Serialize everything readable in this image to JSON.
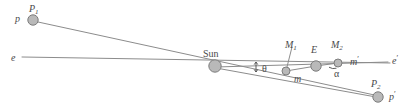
{
  "figure": {
    "type": "astronomical-geometry-diagram",
    "background": "#ffffff",
    "line_color": "#8c8c8c",
    "body_fill": "#b9b9b9",
    "body_stroke": "#7d7d7d",
    "label_color": "#4a4a4a",
    "width": 414,
    "height": 111
  },
  "bodies": [
    {
      "id": "P1",
      "label": "P",
      "sub": "1",
      "x": 33,
      "y": 20,
      "r": 5.2
    },
    {
      "id": "Sun",
      "label": "Sun",
      "sub": "",
      "x": 215,
      "y": 66,
      "r": 6.2
    },
    {
      "id": "M1",
      "label": "M",
      "sub": "1",
      "x": 286,
      "y": 71,
      "r": 4.0
    },
    {
      "id": "E",
      "label": "E",
      "sub": "",
      "x": 316,
      "y": 66,
      "r": 5.2
    },
    {
      "id": "M2",
      "label": "M",
      "sub": "2",
      "x": 338,
      "y": 63,
      "r": 4.0
    },
    {
      "id": "P2",
      "label": "P",
      "sub": "2",
      "x": 378,
      "y": 97,
      "r": 5.2
    }
  ],
  "labels": {
    "p1": {
      "text": "P",
      "sub": "1",
      "x": 29,
      "y": 4
    },
    "p": {
      "text": "p",
      "x": 15,
      "y": 14
    },
    "e": {
      "text": "e",
      "x": 11,
      "y": 53
    },
    "sun": {
      "text": "Sun",
      "x": 203,
      "y": 49
    },
    "m1": {
      "text": "M",
      "sub": "1",
      "x": 285,
      "y": 40
    },
    "m": {
      "text": "m",
      "x": 294,
      "y": 74
    },
    "bigE": {
      "text": "E",
      "x": 311,
      "y": 45
    },
    "m2": {
      "text": "M",
      "sub": "2",
      "x": 331,
      "y": 40
    },
    "alpha": {
      "text": "α",
      "x": 334,
      "y": 69
    },
    "mprime": {
      "text": "m",
      "sup": "′",
      "x": 350,
      "y": 57
    },
    "theta": {
      "text": "θ",
      "x": 262,
      "y": 64
    },
    "eprime": {
      "text": "e",
      "sup": "′",
      "x": 392,
      "y": 56
    },
    "p2": {
      "text": "P",
      "sub": "2",
      "x": 371,
      "y": 79
    },
    "pprime": {
      "text": "p",
      "sup": "′",
      "x": 389,
      "y": 92
    }
  },
  "lines": [
    {
      "name": "ecliptic-line",
      "x1": 22,
      "y1": 57,
      "x2": 390,
      "y2": 63
    },
    {
      "name": "p1-to-p2-sight-line",
      "x1": 38,
      "y1": 22,
      "x2": 379,
      "y2": 96
    },
    {
      "name": "sun-to-mprime-line",
      "x1": 216,
      "y1": 67,
      "x2": 388,
      "y2": 62
    },
    {
      "name": "sun-to-p2-line",
      "x1": 216,
      "y1": 68,
      "x2": 376,
      "y2": 97
    },
    {
      "name": "m1-to-e-segment",
      "x1": 286,
      "y1": 71,
      "x2": 316,
      "y2": 66
    },
    {
      "name": "e-to-m2-segment",
      "x1": 316,
      "y1": 66,
      "x2": 338,
      "y2": 63
    },
    {
      "name": "m1-leader-line",
      "x1": 292,
      "y1": 47,
      "x2": 287,
      "y2": 67
    }
  ],
  "angle_markers": {
    "theta_tick": {
      "name": "theta-extent-arrow",
      "x": 256,
      "y_top": 62,
      "y_bottom": 72
    },
    "alpha_arc": {
      "name": "alpha-angle-arc",
      "cx": 338,
      "cy": 63
    }
  }
}
